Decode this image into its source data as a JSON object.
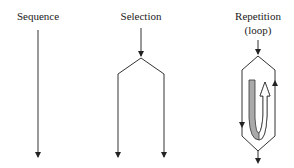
{
  "diagram": {
    "structures": [
      {
        "id": "sequence",
        "label": "Sequence"
      },
      {
        "id": "selection",
        "label": "Selection"
      },
      {
        "id": "repetition",
        "label": "Repetition",
        "sublabel": "(loop)"
      }
    ],
    "colors": {
      "line": "#333333",
      "loop_band_fill": "#a9a9a9",
      "background": "#ffffff"
    }
  }
}
